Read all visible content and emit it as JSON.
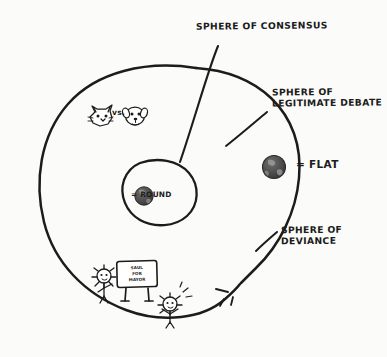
{
  "diagram": {
    "title_note": "Spheres of Consensus diagram",
    "background_color": "#fbfbf9",
    "ink_color": "#1c1c1c"
  },
  "labels": {
    "consensus": "SPHERE OF CONSENSUS",
    "debate_line1": "SPHERE OF",
    "debate_line2": "LEGITIMATE DEBATE",
    "deviance_line1": "SPHERE OF",
    "deviance_line2": "DEVIANCE"
  },
  "legend": {
    "flat": "= FLAT",
    "round": "= ROUND"
  },
  "inner_content": {
    "vs_text": "vs.",
    "cat_icon": "cat-face-icon",
    "dog_icon": "dog-face-icon"
  },
  "protest": {
    "sign_line1": "SAUL",
    "sign_line2": "FOR",
    "sign_line3": "MAYOR"
  },
  "icons": {
    "globe_outer": "globe-flat-icon",
    "globe_inner": "globe-round-icon",
    "protester_left": "protester-figure-icon",
    "protester_right": "protester-figure-icon"
  }
}
